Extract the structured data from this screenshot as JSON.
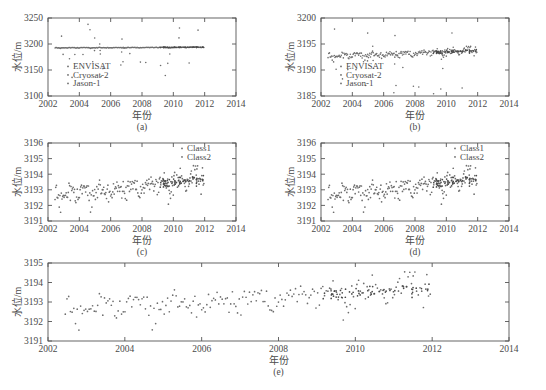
{
  "figure": {
    "background_color": "#ffffff",
    "axis_color": "#555555",
    "text_color": "#4a4a4a",
    "point_color": "#6d6d6d",
    "point_color_class2": "#4a4a4a"
  },
  "chart_data": [
    {
      "type": "scatter",
      "panel": "a",
      "caption": "(a)",
      "title": "",
      "xlabel": "年份",
      "ylabel": "水位/m",
      "xlim": [
        2002,
        2014
      ],
      "ylim": [
        3100,
        3250
      ],
      "xticks": [
        2002,
        2004,
        2006,
        2008,
        2010,
        2012,
        2014
      ],
      "yticks": [
        3100,
        3150,
        3200,
        3250
      ],
      "grid": false,
      "legend_position": "lower-left",
      "legend": [
        "ENVISAT",
        "Cryosat-2",
        "Jason-1"
      ],
      "series": [
        {
          "name": "ENVISAT",
          "x": [
            2002.55,
            2002.62,
            2002.7,
            2002.78,
            2002.86,
            2002.94,
            2003.02,
            2003.1,
            2003.18,
            2003.26,
            2003.34,
            2003.42,
            2003.5,
            2003.58,
            2003.66,
            2003.74,
            2003.82,
            2003.9,
            2003.98,
            2004.06,
            2004.14,
            2004.22,
            2004.3,
            2004.38,
            2004.46,
            2004.54,
            2004.62,
            2004.7,
            2004.78,
            2004.86,
            2004.94,
            2005.02,
            2005.1,
            2005.18,
            2005.26,
            2005.34,
            2005.42,
            2005.5,
            2005.58,
            2005.66,
            2005.74,
            2005.82,
            2005.9,
            2005.98,
            2006.06,
            2006.14,
            2006.22,
            2006.3,
            2006.38,
            2006.46,
            2006.54,
            2006.62,
            2006.7,
            2006.78,
            2006.86,
            2006.94,
            2007.02,
            2007.1,
            2007.18,
            2007.26,
            2007.34,
            2007.42,
            2007.5,
            2007.58,
            2007.66,
            2007.74,
            2007.82,
            2007.9,
            2007.98,
            2008.06,
            2008.14,
            2008.22,
            2008.3,
            2008.38,
            2008.46,
            2008.54,
            2008.62,
            2008.7,
            2008.78,
            2008.86,
            2008.94,
            2009.02,
            2009.1,
            2009.18,
            2009.26,
            2009.34,
            2009.42,
            2009.5,
            2009.58,
            2009.66,
            2009.74,
            2009.82,
            2009.9,
            2009.98,
            2010.06,
            2010.14,
            2010.22,
            2010.3,
            2010.38,
            2010.46,
            2010.54,
            2010.62,
            2010.7,
            2010.78,
            2010.86,
            2010.94,
            2011.02,
            2011.1,
            2011.18,
            2011.26,
            2011.34,
            2011.42,
            2011.5,
            2011.58,
            2011.66,
            2011.74,
            2011.82,
            2011.9
          ],
          "y": [
            3192.5,
            3192.3,
            3192.8,
            3192.1,
            3193.0,
            3192.6,
            3192.9,
            3192.4,
            3193.2,
            3192.7,
            3192.5,
            3192.2,
            3192.8,
            3192.0,
            3192.6,
            3192.4,
            3192.9,
            3192.3,
            3192.7,
            3192.1,
            3192.5,
            3192.8,
            3192.2,
            3192.6,
            3192.0,
            3192.4,
            3192.9,
            3192.3,
            3192.7,
            3192.5,
            3192.1,
            3192.8,
            3193.2,
            3192.6,
            3192.4,
            3191.8,
            3192.2,
            3192.7,
            3193.0,
            3192.5,
            3192.3,
            3192.9,
            3193.1,
            3192.6,
            3192.8,
            3193.3,
            3192.4,
            3193.0,
            3192.7,
            3193.2,
            3192.9,
            3192.5,
            3193.1,
            3192.8,
            3193.4,
            3192.6,
            3193.0,
            3193.3,
            3192.7,
            3193.1,
            3192.9,
            3193.5,
            3193.2,
            3192.8,
            3193.6,
            3193.0,
            3193.3,
            3192.9,
            3193.4,
            3193.1,
            3193.7,
            3193.2,
            3192.8,
            3193.5,
            3193.0,
            3193.3,
            3193.8,
            3193.1,
            3193.6,
            3193.2,
            3193.4,
            3193.0,
            3193.7,
            3193.3,
            3193.5,
            3193.9,
            3193.1,
            3193.6,
            3193.2,
            3193.8,
            3193.4,
            3193.0,
            3193.7,
            3193.3,
            3193.5,
            3193.9,
            3193.2,
            3193.6,
            3193.4,
            3194.0,
            3193.1,
            3193.7,
            3193.3,
            3193.8,
            3193.5,
            3194.1,
            3193.2,
            3193.9,
            3193.6,
            3194.2,
            3193.4,
            3193.8,
            3194.0,
            3193.5,
            3194.3,
            3193.7,
            3193.9,
            3194.1,
            3193.6
          ]
        },
        {
          "name": "Cryosat-2",
          "x": [
            2010.3,
            2010.5,
            2010.7,
            2010.9,
            2011.1,
            2011.3,
            2011.5,
            2011.7,
            2011.9
          ],
          "y": [
            3193.5,
            3193.8,
            3193.6,
            3194.0,
            3193.7,
            3194.1,
            3193.9,
            3194.2,
            3193.8
          ]
        },
        {
          "name": "Jason-1",
          "x": [
            2003.2,
            2004.1,
            2005.0,
            2005.6,
            2006.2,
            2006.8,
            2008.4,
            2009.1,
            2010.2,
            2010.8,
            2011.3
          ],
          "y": [
            3210.0,
            3205.0,
            3215.0,
            3220.0,
            3212.0,
            3208.0,
            3140.0,
            3175.0,
            3222.0,
            3218.0,
            3228.0
          ]
        }
      ],
      "outlier_note": "Jason-1 shows large scatter 3100-3250"
    },
    {
      "type": "scatter",
      "panel": "b",
      "caption": "(b)",
      "title": "",
      "xlabel": "年份",
      "ylabel": "水位/m",
      "xlim": [
        2002,
        2014
      ],
      "ylim": [
        3185,
        3200
      ],
      "xticks": [
        2002,
        2004,
        2006,
        2008,
        2010,
        2012,
        2014
      ],
      "yticks": [
        3185,
        3190,
        3195,
        3200
      ],
      "grid": false,
      "legend_position": "lower-left",
      "legend": [
        "ENVISAT",
        "Cryosat-2",
        "Jason-1"
      ]
    },
    {
      "type": "scatter",
      "panel": "c",
      "caption": "(c)",
      "title": "",
      "xlabel": "年份",
      "ylabel": "水位/m",
      "xlim": [
        2002,
        2014
      ],
      "ylim": [
        3191,
        3196
      ],
      "xticks": [
        2002,
        2004,
        2006,
        2008,
        2010,
        2012,
        2014
      ],
      "yticks": [
        3191,
        3192,
        3193,
        3194,
        3195,
        3196
      ],
      "grid": false,
      "legend_position": "upper-right",
      "legend": [
        "Class1",
        "Class2"
      ]
    },
    {
      "type": "scatter",
      "panel": "d",
      "caption": "(d)",
      "title": "",
      "xlabel": "年份",
      "ylabel": "水位/m",
      "xlim": [
        2002,
        2014
      ],
      "ylim": [
        3191,
        3196
      ],
      "xticks": [
        2002,
        2004,
        2006,
        2008,
        2010,
        2012,
        2014
      ],
      "yticks": [
        3191,
        3192,
        3193,
        3194,
        3195,
        3196
      ],
      "grid": false,
      "legend_position": "upper-right",
      "legend": [
        "Class1",
        "Class2"
      ]
    },
    {
      "type": "scatter",
      "panel": "e",
      "caption": "(e)",
      "title": "",
      "xlabel": "年份",
      "ylabel": "水位/m",
      "xlim": [
        2002,
        2014
      ],
      "ylim": [
        3191,
        3195
      ],
      "xticks": [
        2002,
        2004,
        2006,
        2008,
        2010,
        2012,
        2014
      ],
      "yticks": [
        3191,
        3192,
        3193,
        3194,
        3195
      ],
      "grid": false,
      "legend_position": "none",
      "legend": []
    }
  ],
  "panels": {
    "a": {
      "caption": "(a)",
      "xlabel": "年份",
      "ylabel": "水位/m",
      "xticks": [
        "2002",
        "2004",
        "2006",
        "2008",
        "2010",
        "2012",
        "2014"
      ],
      "yticks": [
        "3250",
        "3200",
        "3150",
        "3100"
      ],
      "legend": [
        "ENVISAT",
        "Cryosat-2",
        "Jason-1"
      ]
    },
    "b": {
      "caption": "(b)",
      "xlabel": "年份",
      "ylabel": "水位/m",
      "xticks": [
        "2002",
        "2004",
        "2006",
        "2008",
        "2010",
        "2012",
        "2014"
      ],
      "yticks": [
        "3200",
        "3195",
        "3190",
        "3185"
      ],
      "legend": [
        "ENVISAT",
        "Cryosat-2",
        "Jason-1"
      ]
    },
    "c": {
      "caption": "(c)",
      "xlabel": "年份",
      "ylabel": "水位/m",
      "xticks": [
        "2002",
        "2004",
        "2006",
        "2008",
        "2010",
        "2012",
        "2014"
      ],
      "yticks": [
        "3196",
        "3195",
        "3194",
        "3193",
        "3192",
        "3191"
      ],
      "legend": [
        "Class1",
        "Class2"
      ]
    },
    "d": {
      "caption": "(d)",
      "xlabel": "年份",
      "ylabel": "水位/m",
      "xticks": [
        "2002",
        "2004",
        "2006",
        "2008",
        "2010",
        "2012",
        "2014"
      ],
      "yticks": [
        "3196",
        "3195",
        "3194",
        "3193",
        "3192",
        "3191"
      ],
      "legend": [
        "Class1",
        "Class2"
      ]
    },
    "e": {
      "caption": "(e)",
      "xlabel": "年份",
      "ylabel": "水位/m",
      "xticks": [
        "2002",
        "2004",
        "2006",
        "2008",
        "2010",
        "2012",
        "2014"
      ],
      "yticks": [
        "3195",
        "3194",
        "3193",
        "3192",
        "3191"
      ],
      "legend": []
    }
  }
}
